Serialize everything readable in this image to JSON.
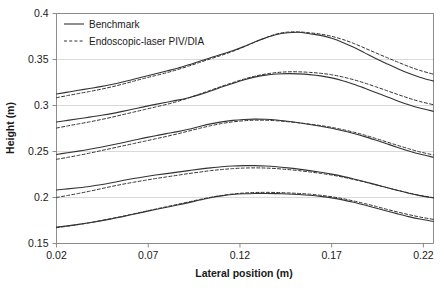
{
  "chart_data": {
    "type": "line",
    "title": "",
    "xlabel": "Lateral position (m)",
    "ylabel": "Height (m)",
    "xlim": [
      0.02,
      0.2255
    ],
    "ylim": [
      0.15,
      0.4
    ],
    "xticks": [
      "0.02",
      "0.07",
      "0.12",
      "0.17",
      "0.22"
    ],
    "xtick_values": [
      0.02,
      0.07,
      0.12,
      0.17,
      0.22
    ],
    "yticks": [
      "0.15",
      "0.2",
      "0.25",
      "0.3",
      "0.35",
      "0.4"
    ],
    "ytick_values": [
      0.15,
      0.2,
      0.25,
      0.3,
      0.35,
      0.4
    ],
    "grid": "horizontal",
    "legend_position": "top-left-inside",
    "legend": [
      {
        "name": "Benchmark",
        "style": "solid"
      },
      {
        "name": "Endoscopic-laser PIV/DIA",
        "style": "dashed"
      }
    ],
    "x": [
      0.02,
      0.026,
      0.032,
      0.038,
      0.044,
      0.05,
      0.056,
      0.062,
      0.068,
      0.074,
      0.08,
      0.086,
      0.092,
      0.098,
      0.104,
      0.11,
      0.116,
      0.122,
      0.128,
      0.134,
      0.14,
      0.146,
      0.152,
      0.158,
      0.164,
      0.17,
      0.176,
      0.182,
      0.188,
      0.194,
      0.2,
      0.206,
      0.212,
      0.218,
      0.2255
    ],
    "series": [
      {
        "name": "Profile 5 - Benchmark",
        "pair": 5,
        "style": "solid",
        "values": [
          0.3125,
          0.3145,
          0.3165,
          0.3185,
          0.3205,
          0.3228,
          0.3255,
          0.3285,
          0.3315,
          0.3345,
          0.3375,
          0.3405,
          0.3442,
          0.3482,
          0.352,
          0.3556,
          0.3596,
          0.364,
          0.369,
          0.3735,
          0.3772,
          0.379,
          0.3796,
          0.378,
          0.3762,
          0.373,
          0.3686,
          0.3632,
          0.3572,
          0.3512,
          0.3455,
          0.34,
          0.335,
          0.3308,
          0.3265
        ]
      },
      {
        "name": "Profile 5 - Endoscopic-laser PIV/DIA",
        "pair": 5,
        "style": "dashed",
        "values": [
          0.3085,
          0.3108,
          0.313,
          0.3152,
          0.3176,
          0.3202,
          0.3232,
          0.3264,
          0.3296,
          0.3326,
          0.3356,
          0.339,
          0.3428,
          0.3468,
          0.3508,
          0.3546,
          0.3588,
          0.3636,
          0.3688,
          0.3736,
          0.3778,
          0.3798,
          0.38,
          0.379,
          0.3776,
          0.3752,
          0.3718,
          0.3675,
          0.3624,
          0.3572,
          0.3522,
          0.3472,
          0.3424,
          0.3382,
          0.334
        ]
      },
      {
        "name": "Profile 4 - Benchmark",
        "pair": 4,
        "style": "solid",
        "values": [
          0.282,
          0.2838,
          0.2856,
          0.2874,
          0.2892,
          0.2912,
          0.2936,
          0.2962,
          0.2988,
          0.3012,
          0.3035,
          0.3058,
          0.3085,
          0.3118,
          0.3158,
          0.32,
          0.324,
          0.3278,
          0.3308,
          0.333,
          0.3342,
          0.3346,
          0.3344,
          0.3336,
          0.3322,
          0.33,
          0.327,
          0.3232,
          0.3188,
          0.3142,
          0.3096,
          0.305,
          0.3008,
          0.2972,
          0.2938
        ]
      },
      {
        "name": "Profile 4 - Endoscopic-laser PIV/DIA",
        "pair": 4,
        "style": "dashed",
        "values": [
          0.2755,
          0.2778,
          0.28,
          0.2822,
          0.2846,
          0.2872,
          0.29,
          0.2928,
          0.2956,
          0.2984,
          0.3012,
          0.3044,
          0.3082,
          0.3124,
          0.3166,
          0.3208,
          0.3248,
          0.3286,
          0.3318,
          0.3342,
          0.3358,
          0.3366,
          0.3366,
          0.336,
          0.335,
          0.3334,
          0.331,
          0.328,
          0.3244,
          0.3204,
          0.3162,
          0.312,
          0.308,
          0.3044,
          0.3008
        ]
      },
      {
        "name": "Profile 3 - Benchmark",
        "pair": 3,
        "style": "solid",
        "values": [
          0.2468,
          0.2486,
          0.2504,
          0.2524,
          0.2546,
          0.257,
          0.2596,
          0.2622,
          0.2648,
          0.2672,
          0.2694,
          0.2716,
          0.2742,
          0.2772,
          0.28,
          0.2822,
          0.2838,
          0.2848,
          0.2852,
          0.285,
          0.2842,
          0.2828,
          0.2812,
          0.2794,
          0.2774,
          0.2752,
          0.2726,
          0.2696,
          0.2662,
          0.2624,
          0.2584,
          0.2544,
          0.2506,
          0.2472,
          0.2438
        ]
      },
      {
        "name": "Profile 3 - Endoscopic-laser PIV/DIA",
        "pair": 3,
        "style": "dashed",
        "values": [
          0.2415,
          0.2436,
          0.2458,
          0.2482,
          0.2508,
          0.2534,
          0.256,
          0.2586,
          0.2612,
          0.2638,
          0.2664,
          0.2692,
          0.2722,
          0.2752,
          0.278,
          0.2804,
          0.2822,
          0.2834,
          0.284,
          0.284,
          0.2834,
          0.2824,
          0.2812,
          0.2798,
          0.2782,
          0.2762,
          0.2738,
          0.271,
          0.2678,
          0.2642,
          0.2604,
          0.2566,
          0.253,
          0.2496,
          0.2462
        ]
      },
      {
        "name": "Profile 2 - Benchmark",
        "pair": 2,
        "style": "solid",
        "values": [
          0.2082,
          0.2094,
          0.2106,
          0.212,
          0.2138,
          0.216,
          0.2184,
          0.2206,
          0.2226,
          0.2244,
          0.226,
          0.2276,
          0.2292,
          0.2308,
          0.2322,
          0.2334,
          0.2342,
          0.2346,
          0.2346,
          0.2342,
          0.2334,
          0.2322,
          0.2308,
          0.2292,
          0.2274,
          0.2254,
          0.223,
          0.2202,
          0.2172,
          0.214,
          0.2108,
          0.2076,
          0.2046,
          0.202,
          0.1994
        ]
      },
      {
        "name": "Profile 2 - Endoscopic-laser PIV/DIA",
        "pair": 2,
        "style": "dashed",
        "values": [
          0.2,
          0.2022,
          0.2044,
          0.2068,
          0.2094,
          0.212,
          0.2144,
          0.2166,
          0.2186,
          0.2206,
          0.2224,
          0.2242,
          0.226,
          0.2276,
          0.2292,
          0.2304,
          0.2314,
          0.232,
          0.2322,
          0.232,
          0.2314,
          0.2304,
          0.2292,
          0.2278,
          0.2262,
          0.2244,
          0.2222,
          0.2196,
          0.2168,
          0.2138,
          0.2108,
          0.2078,
          0.205,
          0.2024,
          0.1998
        ]
      },
      {
        "name": "Profile 1 - Benchmark",
        "pair": 1,
        "style": "solid",
        "values": [
          0.1678,
          0.1692,
          0.1708,
          0.1726,
          0.1746,
          0.1768,
          0.1792,
          0.1818,
          0.1844,
          0.187,
          0.1894,
          0.1918,
          0.1944,
          0.1972,
          0.1998,
          0.2018,
          0.2032,
          0.204,
          0.2044,
          0.2044,
          0.2042,
          0.2038,
          0.2032,
          0.2024,
          0.2012,
          0.1996,
          0.1974,
          0.1948,
          0.1918,
          0.1886,
          0.1854,
          0.1822,
          0.1792,
          0.1766,
          0.174
        ]
      },
      {
        "name": "Profile 1 - Endoscopic-laser PIV/DIA",
        "pair": 1,
        "style": "dashed",
        "values": [
          0.1672,
          0.1688,
          0.1706,
          0.1726,
          0.1748,
          0.1772,
          0.1796,
          0.1822,
          0.1848,
          0.1874,
          0.19,
          0.1926,
          0.1952,
          0.1978,
          0.2002,
          0.2022,
          0.2038,
          0.2048,
          0.2054,
          0.2056,
          0.2054,
          0.205,
          0.2044,
          0.2036,
          0.2024,
          0.2008,
          0.1988,
          0.1962,
          0.1934,
          0.1904,
          0.1872,
          0.1842,
          0.1814,
          0.1788,
          0.1762
        ]
      }
    ]
  },
  "style": {
    "line_color": "#333333",
    "grid_color": "#cfcfcf",
    "axis_color": "#808080",
    "background": "#ffffff"
  },
  "caption": {
    "text": ""
  }
}
